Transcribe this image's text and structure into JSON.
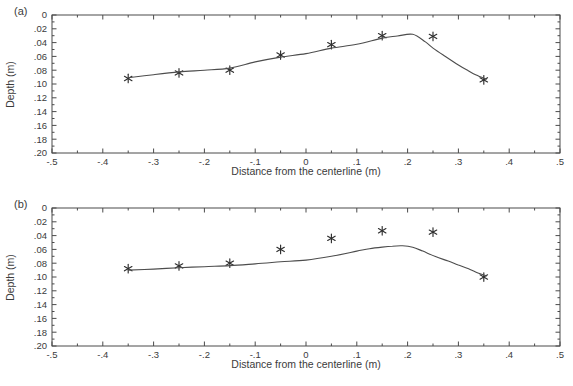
{
  "colors": {
    "background": "#ffffff",
    "ink": "#3b3b3b",
    "axis": "#4a4a4a",
    "curve": "#4d4d4d",
    "marker": "#2e2e2e"
  },
  "chart_data": [
    {
      "type": "line",
      "panel_label": "(a)",
      "xlabel": "Distance from the centerline (m)",
      "ylabel": "Depth (m)",
      "xlim": [
        -0.5,
        0.5
      ],
      "ylim": [
        0,
        0.2
      ],
      "y_axis_direction": "depth-increases-downward",
      "grid": false,
      "legend": "none",
      "x_ticks": [
        -0.5,
        -0.4,
        -0.3,
        -0.2,
        -0.1,
        0,
        0.1,
        0.2,
        0.3,
        0.4,
        0.5
      ],
      "x_tick_labels": [
        "-.5",
        "-.4",
        "-.3",
        "-.2",
        "-.1",
        "0",
        ".1",
        ".2",
        ".3",
        ".4",
        ".5"
      ],
      "y_ticks": [
        0,
        0.02,
        0.04,
        0.06,
        0.08,
        0.1,
        0.12,
        0.14,
        0.16,
        0.18,
        0.2
      ],
      "y_tick_labels": [
        "0",
        ".02",
        ".04",
        ".06",
        ".08",
        ".10",
        ".12",
        ".14",
        ".16",
        ".18",
        ".20"
      ],
      "series": [
        {
          "name": "measured-points",
          "style": "scatter",
          "marker": "asterisk",
          "x": [
            -0.35,
            -0.25,
            -0.15,
            -0.05,
            0.05,
            0.15,
            0.25,
            0.35
          ],
          "y": [
            0.092,
            0.084,
            0.08,
            0.058,
            0.043,
            0.03,
            0.031,
            0.094
          ]
        },
        {
          "name": "model-curve",
          "style": "line",
          "x": [
            -0.35,
            -0.3,
            -0.25,
            -0.2,
            -0.15,
            -0.1,
            -0.05,
            0.0,
            0.05,
            0.1,
            0.15,
            0.18,
            0.21,
            0.235,
            0.25,
            0.27,
            0.3,
            0.32,
            0.335,
            0.355
          ],
          "y": [
            0.091,
            0.0865,
            0.0825,
            0.08,
            0.077,
            0.068,
            0.061,
            0.056,
            0.048,
            0.0425,
            0.0335,
            0.0305,
            0.028,
            0.039,
            0.048,
            0.058,
            0.0725,
            0.081,
            0.087,
            0.093
          ]
        }
      ]
    },
    {
      "type": "line",
      "panel_label": "(b)",
      "xlabel": "Distance from the centerline (m)",
      "ylabel": "Depth (m)",
      "xlim": [
        -0.5,
        0.5
      ],
      "ylim": [
        0,
        0.2
      ],
      "y_axis_direction": "depth-increases-downward",
      "grid": false,
      "legend": "none",
      "x_ticks": [
        -0.5,
        -0.4,
        -0.3,
        -0.2,
        -0.1,
        0,
        0.1,
        0.2,
        0.3,
        0.4,
        0.5
      ],
      "x_tick_labels": [
        "-.5",
        "-.4",
        "-.3",
        "-.2",
        "-.1",
        "0",
        ".1",
        ".2",
        ".3",
        ".4",
        ".5"
      ],
      "y_ticks": [
        0,
        0.02,
        0.04,
        0.06,
        0.08,
        0.1,
        0.12,
        0.14,
        0.16,
        0.18,
        0.2
      ],
      "y_tick_labels": [
        "0",
        ".02",
        ".04",
        ".06",
        ".08",
        ".10",
        ".12",
        ".14",
        ".16",
        ".18",
        ".20"
      ],
      "series": [
        {
          "name": "measured-points",
          "style": "scatter",
          "marker": "asterisk",
          "x": [
            -0.35,
            -0.25,
            -0.15,
            -0.05,
            0.05,
            0.15,
            0.25,
            0.35
          ],
          "y": [
            0.088,
            0.084,
            0.08,
            0.06,
            0.044,
            0.033,
            0.035,
            0.1
          ]
        },
        {
          "name": "model-curve",
          "style": "line",
          "x": [
            -0.35,
            -0.3,
            -0.25,
            -0.2,
            -0.15,
            -0.1,
            -0.05,
            0.0,
            0.05,
            0.1,
            0.125,
            0.15,
            0.17,
            0.19,
            0.21,
            0.23,
            0.255,
            0.28,
            0.3,
            0.32,
            0.34,
            0.355
          ],
          "y": [
            0.09,
            0.0885,
            0.0865,
            0.085,
            0.0835,
            0.081,
            0.078,
            0.0755,
            0.07,
            0.0625,
            0.059,
            0.0567,
            0.0553,
            0.0548,
            0.057,
            0.0625,
            0.0705,
            0.077,
            0.0827,
            0.088,
            0.0945,
            0.0985
          ]
        }
      ]
    }
  ]
}
